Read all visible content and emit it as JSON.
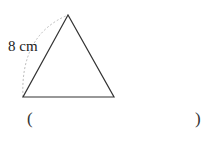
{
  "diagram": {
    "shape": "equilateral-triangle",
    "side_label": "8 cm",
    "stroke_color": "#333333",
    "arc_color": "#bbbbbb"
  },
  "answer": {
    "open_paren": "(",
    "close_paren": ")",
    "value": ""
  }
}
